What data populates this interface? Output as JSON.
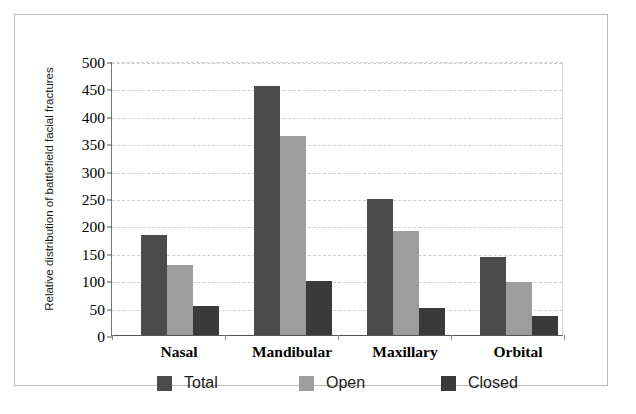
{
  "chart_data": {
    "type": "bar",
    "title": "",
    "subtitle": "",
    "xlabel": "",
    "ylabel": "Relative distribution of battlefield facial fractures",
    "categories": [
      "Nasal",
      "Mandibular",
      "Maxillary",
      "Orbital"
    ],
    "series": [
      {
        "name": "Total",
        "color": "#4b4b4b",
        "values": [
          182,
          455,
          248,
          142
        ]
      },
      {
        "name": "Open",
        "color": "#9d9d9d",
        "values": [
          128,
          363,
          190,
          97
        ]
      },
      {
        "name": "Closed",
        "color": "#3a3a3a",
        "values": [
          53,
          98,
          50,
          35
        ]
      }
    ],
    "ylim": [
      0,
      500
    ],
    "ytick_labels": [
      "0",
      "50",
      "100",
      "150",
      "200",
      "250",
      "300",
      "350",
      "400",
      "450",
      "500"
    ],
    "ytick_values": [
      0,
      50,
      100,
      150,
      200,
      250,
      300,
      350,
      400,
      450,
      500
    ],
    "grid": true,
    "grid_style": "dashed-horizontal",
    "legend_position": "bottom",
    "legend_entries": [
      "Total",
      "Open",
      "Closed"
    ],
    "frame": true,
    "background_color": "#ffffff"
  }
}
